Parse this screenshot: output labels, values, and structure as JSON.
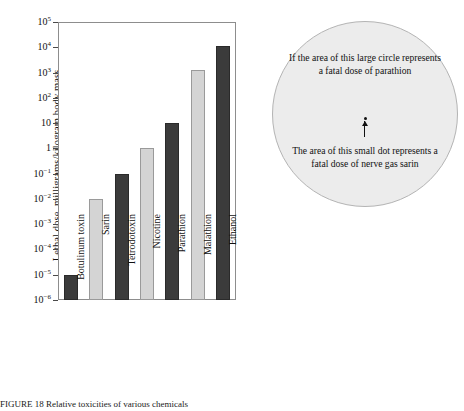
{
  "chart_data": {
    "type": "bar",
    "title": "",
    "xlabel": "",
    "ylabel": "Lethal dose, milligrams/kilogram body mass",
    "scale": "log10",
    "ylim": [
      1e-06,
      100000.0
    ],
    "grid": false,
    "legend": "none",
    "categories": [
      "Botulinum toxin",
      "Sarin",
      "Tetrodotoxin",
      "Nicotine",
      "Parathion",
      "Malathion",
      "Ethanol"
    ],
    "values": [
      1e-05,
      0.01,
      0.1,
      1,
      10,
      1300,
      11000
    ],
    "value_labels": [
      "10^-5",
      "10^-2",
      "10^-1",
      "1",
      "10",
      "1.3 x 10^3",
      "1.1 x 10^4"
    ],
    "bar_colors": [
      "#3b3b3b",
      "#d4d4d4",
      "#3b3b3b",
      "#d4d4d4",
      "#3b3b3b",
      "#d4d4d4",
      "#3b3b3b"
    ],
    "ytick_values": [
      100000.0,
      10000.0,
      1000.0,
      100,
      10,
      1,
      0.1,
      0.01,
      0.001,
      0.0001,
      1e-05,
      1e-06
    ],
    "ytick_labels": [
      {
        "mantissa": "10",
        "exp": "5"
      },
      {
        "mantissa": "10",
        "exp": "4"
      },
      {
        "mantissa": "10",
        "exp": "3"
      },
      {
        "mantissa": "10",
        "exp": "2"
      },
      {
        "mantissa": "10",
        "exp": ""
      },
      {
        "mantissa": "1",
        "exp": ""
      },
      {
        "mantissa": "10",
        "exp": "-1"
      },
      {
        "mantissa": "10",
        "exp": "-2"
      },
      {
        "mantissa": "10",
        "exp": "-3"
      },
      {
        "mantissa": "10",
        "exp": "-4"
      },
      {
        "mantissa": "10",
        "exp": "-5"
      },
      {
        "mantissa": "10",
        "exp": "-6"
      }
    ]
  },
  "callout": {
    "text_top": "If the area of this large circle represents a fatal dose of parathion",
    "text_bottom": "The area of this small dot represents a fatal dose of nerve gas sarin",
    "fill_color": "#ececec",
    "border_color": "#b4b4b4"
  },
  "caption": {
    "text": "FIGURE 18   Relative toxicities of various chemicals"
  }
}
